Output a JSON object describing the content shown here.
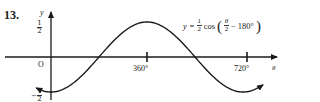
{
  "problem": {
    "number": "13."
  },
  "chart_data": {
    "type": "line",
    "xlabel": "θ",
    "ylabel": "y",
    "x_ticks": [
      "360°",
      "720°"
    ],
    "y_ticks": [
      "1/2",
      "-1/2"
    ],
    "origin_label": "O",
    "xlim": [
      -40,
      770
    ],
    "ylim": [
      -0.5,
      0.5
    ],
    "x": [
      0,
      180,
      360,
      540,
      720
    ],
    "values": [
      -0.5,
      0,
      0.5,
      0,
      -0.5
    ],
    "grid": false,
    "legend": null,
    "period_deg": 720,
    "amplitude": 0.5
  },
  "labels": {
    "y_axis": "y",
    "x_axis": "θ",
    "origin": "O",
    "tick_360": "360°",
    "tick_720": "720°",
    "y_top_num": "1",
    "y_top_den": "2",
    "y_bot_sign": "−",
    "y_bot_num": "1",
    "y_bot_den": "2"
  },
  "equation": {
    "lhs": "y =",
    "coef_num": "1",
    "coef_den": "2",
    "func": "cos",
    "open": "(",
    "arg_num": "θ",
    "arg_den": "2",
    "minus": "−",
    "shift": "180°",
    "close": ")"
  },
  "colors": {
    "ink": "#1a1a1a",
    "background": "#ffffff"
  }
}
